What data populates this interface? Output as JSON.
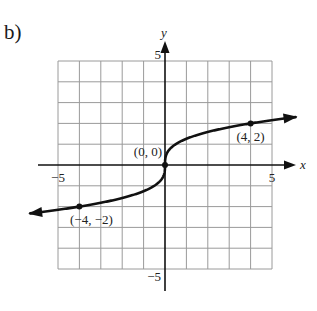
{
  "panel_label": "b)",
  "chart_data": {
    "type": "line",
    "title": "",
    "function": "y = cbrt(2x)",
    "xlabel": "x",
    "ylabel": "y",
    "xlim": [
      -5,
      5
    ],
    "ylim": [
      -5,
      5
    ],
    "grid": true,
    "grid_step": 1,
    "x_tick_labels": [
      {
        "value": -5,
        "label": "−5"
      },
      {
        "value": 5,
        "label": "5"
      }
    ],
    "y_tick_labels": [
      {
        "value": 5,
        "label": "5"
      },
      {
        "value": -5,
        "label": "−5"
      }
    ],
    "labeled_points": [
      {
        "x": -4,
        "y": -2,
        "label": "(−4, −2)"
      },
      {
        "x": 0,
        "y": 0,
        "label": "(0, 0)"
      },
      {
        "x": 4,
        "y": 2,
        "label": "(4, 2)"
      }
    ],
    "curve_extends": {
      "left_arrow_at_x": -6.3,
      "right_arrow_at_x": 6.1
    },
    "colors": {
      "curve": "#111111",
      "grid": "#9a9a9a",
      "axes": "#111111"
    }
  }
}
